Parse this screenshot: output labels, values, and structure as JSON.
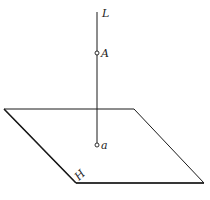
{
  "diagram": {
    "line_label": "L",
    "point_upper_label": "A",
    "point_lower_label": "a",
    "plane_label": "H",
    "stroke_color": "#1a1a1a"
  }
}
